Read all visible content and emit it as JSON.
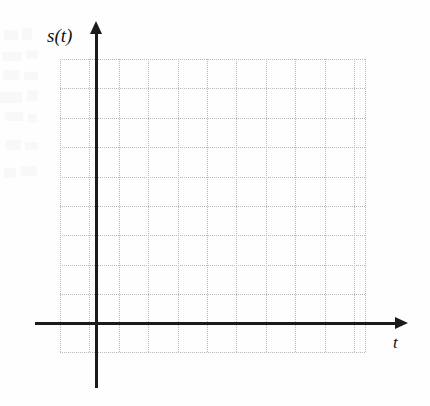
{
  "figure": {
    "kind": "blank-coordinate-grid",
    "background_color": "#fefefe",
    "width": 430,
    "height": 406
  },
  "axes": {
    "y": {
      "label": "s(t)",
      "color": "#1b1b1b",
      "orientation": "vertical",
      "arrow_direction": "up",
      "x_position": 96,
      "line_top": 32,
      "line_bottom": 388,
      "thickness": 3
    },
    "x": {
      "label": "t",
      "color": "#1b1b1b",
      "orientation": "horizontal",
      "arrow_direction": "right",
      "y_position": 323,
      "line_left": 35,
      "line_right": 397,
      "thickness": 3
    },
    "origin": {
      "x": 96,
      "y": 323
    }
  },
  "grid": {
    "style": "dotted",
    "color": "#b9b9b9",
    "cell_size": 29.4,
    "left": 60,
    "right": 365,
    "top": 59,
    "bottom": 352,
    "vertical_lines": [
      60,
      89.4,
      118.8,
      148.2,
      177.6,
      207,
      236.4,
      265.8,
      295.2,
      324.6,
      354,
      365
    ],
    "horizontal_lines": [
      59,
      88.4,
      117.8,
      147.2,
      176.6,
      206,
      235.4,
      264.8,
      294.2,
      323,
      352
    ]
  },
  "ghosts": [
    {
      "x": 4,
      "y": 30,
      "w": 14,
      "h": 10
    },
    {
      "x": 22,
      "y": 28,
      "w": 10,
      "h": 12
    },
    {
      "x": 2,
      "y": 52,
      "w": 20,
      "h": 9
    },
    {
      "x": 26,
      "y": 50,
      "w": 12,
      "h": 9
    },
    {
      "x": 3,
      "y": 70,
      "w": 16,
      "h": 10
    },
    {
      "x": 24,
      "y": 72,
      "w": 14,
      "h": 8
    },
    {
      "x": 0,
      "y": 92,
      "w": 22,
      "h": 11
    },
    {
      "x": 27,
      "y": 90,
      "w": 11,
      "h": 11
    },
    {
      "x": 5,
      "y": 112,
      "w": 18,
      "h": 9
    },
    {
      "x": 28,
      "y": 114,
      "w": 9,
      "h": 9
    },
    {
      "x": 6,
      "y": 140,
      "w": 15,
      "h": 10
    },
    {
      "x": 25,
      "y": 142,
      "w": 13,
      "h": 8
    },
    {
      "x": 4,
      "y": 168,
      "w": 12,
      "h": 10
    },
    {
      "x": 21,
      "y": 166,
      "w": 16,
      "h": 10
    }
  ],
  "chart_data": {
    "type": "line",
    "title": "",
    "xlabel": "t",
    "ylabel": "s(t)",
    "series": [],
    "x": [],
    "values": [],
    "grid": true,
    "legend": "none",
    "note": "Empty axes template — no data is plotted. Dotted grid of 10 columns by 10 cells with arrowheads on both positive axis directions."
  }
}
